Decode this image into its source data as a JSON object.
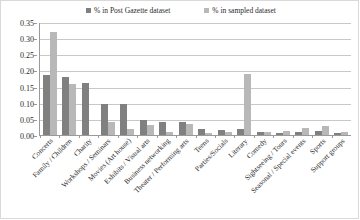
{
  "chart_data": {
    "type": "bar",
    "title": "",
    "subtitle": "",
    "xlabel": "",
    "ylabel": "",
    "ylim": [
      0,
      0.35
    ],
    "ytick_labels": [
      "0.35",
      "0.30",
      "0.25",
      "0.20",
      "0.15",
      "0.10",
      "0.05",
      "0.00"
    ],
    "ytick_values": [
      0.35,
      0.3,
      0.25,
      0.2,
      0.15,
      0.1,
      0.05,
      0.0
    ],
    "grid": true,
    "legend_position": "top-center",
    "categories": [
      "Concerts",
      "Family / Children",
      "Charity",
      "Workshops / Seminars",
      "Movies (Art house)",
      "Exhibits / Visual arts",
      "Business networking",
      "Theater / Performing arts",
      "Teens",
      "Parties/Socials",
      "Literary",
      "Comedy",
      "Sightseeing / Tours",
      "Seasonal / Special events",
      "Sports",
      "Support groups"
    ],
    "series": [
      {
        "name": "% in Post Gazette dataset",
        "color": "#808080",
        "values": [
          0.185,
          0.18,
          0.16,
          0.095,
          0.095,
          0.045,
          0.04,
          0.04,
          0.02,
          0.015,
          0.018,
          0.008,
          0.006,
          0.01,
          0.012,
          0.006
        ]
      },
      {
        "name": "% in sampled dataset",
        "color": "#b8b8b8",
        "values": [
          0.32,
          0.158,
          0.0,
          0.04,
          0.02,
          0.03,
          0.01,
          0.035,
          0.005,
          0.01,
          0.19,
          0.01,
          0.012,
          0.022,
          0.028,
          0.008
        ]
      }
    ]
  },
  "legend": {
    "items": [
      {
        "label": "% in Post Gazette dataset",
        "color": "#808080"
      },
      {
        "label": "% in sampled dataset",
        "color": "#b8b8b8"
      }
    ]
  }
}
